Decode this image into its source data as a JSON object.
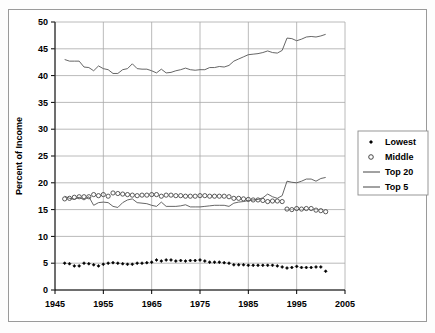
{
  "chart_data": {
    "type": "line",
    "title": "",
    "xlabel": "",
    "ylabel": "Percent of Income",
    "xlim": [
      1945,
      2005
    ],
    "ylim": [
      0,
      50
    ],
    "ytick_step": 5,
    "xtick_step": 10,
    "xticks": [
      "1945",
      "1955",
      "1965",
      "1975",
      "1985",
      "1995",
      "2005"
    ],
    "yticks": [
      "0",
      "5",
      "10",
      "15",
      "20",
      "25",
      "30",
      "35",
      "40",
      "45",
      "50"
    ],
    "grid": true,
    "legend_position": "right-outside",
    "x": [
      1947,
      1948,
      1949,
      1950,
      1951,
      1952,
      1953,
      1954,
      1955,
      1956,
      1957,
      1958,
      1959,
      1960,
      1961,
      1962,
      1963,
      1964,
      1965,
      1966,
      1967,
      1968,
      1969,
      1970,
      1971,
      1972,
      1973,
      1974,
      1975,
      1976,
      1977,
      1978,
      1979,
      1980,
      1981,
      1982,
      1983,
      1984,
      1985,
      1986,
      1987,
      1988,
      1989,
      1990,
      1991,
      1992,
      1993,
      1994,
      1995,
      1996,
      1997,
      1998,
      1999,
      2000,
      2001
    ],
    "series": [
      {
        "name": "Lowest",
        "marker": "filled-diamond",
        "line": false,
        "color": "#000000",
        "values": [
          5.0,
          4.9,
          4.5,
          4.5,
          5.0,
          4.9,
          4.7,
          4.5,
          4.8,
          5.0,
          5.1,
          5.0,
          4.9,
          4.8,
          4.8,
          5.0,
          5.0,
          5.1,
          5.2,
          5.6,
          5.4,
          5.6,
          5.6,
          5.4,
          5.5,
          5.4,
          5.5,
          5.5,
          5.6,
          5.4,
          5.2,
          5.2,
          5.2,
          5.1,
          5.0,
          4.7,
          4.7,
          4.7,
          4.6,
          4.6,
          4.6,
          4.6,
          4.6,
          4.6,
          4.5,
          4.3,
          4.1,
          4.2,
          4.4,
          4.2,
          4.2,
          4.2,
          4.3,
          4.3,
          3.5
        ]
      },
      {
        "name": "Middle",
        "marker": "open-circle",
        "line": false,
        "color": "#000000",
        "values": [
          17.0,
          17.1,
          17.3,
          17.4,
          17.4,
          17.4,
          17.8,
          17.6,
          17.8,
          17.5,
          18.1,
          18.0,
          17.9,
          17.8,
          17.7,
          17.6,
          17.7,
          17.7,
          17.8,
          17.8,
          17.5,
          17.7,
          17.7,
          17.6,
          17.6,
          17.5,
          17.5,
          17.5,
          17.6,
          17.6,
          17.5,
          17.5,
          17.5,
          17.5,
          17.4,
          17.1,
          17.1,
          17.0,
          16.9,
          16.8,
          16.8,
          16.7,
          16.5,
          16.6,
          16.6,
          16.5,
          15.1,
          15.0,
          15.2,
          15.1,
          15.2,
          15.2,
          14.9,
          14.8,
          14.6
        ]
      },
      {
        "name": "Top 20",
        "marker": "none",
        "line": true,
        "color": "#555555",
        "values": [
          43.0,
          42.7,
          42.7,
          42.7,
          41.6,
          41.5,
          40.9,
          41.8,
          41.3,
          41.1,
          40.4,
          40.4,
          41.1,
          41.3,
          42.2,
          41.3,
          41.2,
          41.2,
          40.9,
          40.5,
          41.2,
          40.5,
          40.6,
          40.9,
          41.1,
          41.4,
          41.1,
          41.0,
          41.1,
          41.1,
          41.5,
          41.5,
          41.7,
          41.6,
          41.9,
          42.7,
          43.1,
          43.5,
          43.9,
          44.0,
          44.1,
          44.3,
          44.6,
          44.3,
          44.2,
          44.7,
          47.0,
          46.9,
          46.5,
          46.8,
          47.2,
          47.3,
          47.2,
          47.4,
          47.7
        ]
      },
      {
        "name": "Top 5",
        "marker": "none",
        "line": true,
        "color": "#555555",
        "values": [
          17.5,
          17.1,
          16.9,
          17.3,
          16.8,
          17.4,
          15.8,
          16.3,
          16.4,
          16.3,
          15.6,
          15.4,
          16.3,
          16.8,
          17.0,
          16.3,
          16.2,
          16.1,
          15.8,
          15.6,
          16.4,
          15.6,
          15.6,
          15.6,
          15.7,
          15.9,
          15.5,
          15.5,
          15.5,
          15.6,
          15.7,
          15.8,
          15.8,
          15.8,
          15.6,
          16.2,
          16.4,
          16.5,
          16.7,
          16.8,
          16.9,
          17.2,
          17.9,
          17.4,
          17.1,
          17.6,
          20.3,
          20.1,
          20.0,
          20.3,
          20.7,
          20.7,
          20.3,
          20.8,
          21.0
        ]
      }
    ]
  },
  "legend": {
    "items": [
      {
        "label": "Lowest",
        "type": "marker-dot"
      },
      {
        "label": "Middle",
        "type": "marker-circle"
      },
      {
        "label": "Top 20",
        "type": "line"
      },
      {
        "label": "Top 5",
        "type": "line"
      }
    ]
  }
}
